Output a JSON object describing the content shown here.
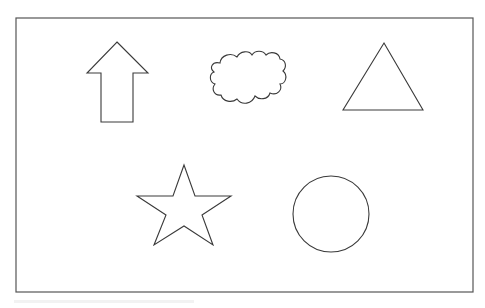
{
  "canvas": {
    "width": 485,
    "height": 308,
    "background": "#ffffff"
  },
  "frame": {
    "x": 16,
    "y": 18,
    "width": 457,
    "height": 274,
    "stroke": "#555555"
  },
  "shapes": [
    {
      "type": "arrow-up",
      "label": "Arrow",
      "points": "117,42 148,73 133,73 133,122 101,122 101,73 87,73",
      "stroke": "#3a3a3a"
    },
    {
      "type": "cloud",
      "label": "Cloud",
      "stroke": "#3a3a3a"
    },
    {
      "type": "triangle",
      "label": "Triangle",
      "points": "384,43 423,110 343,110",
      "stroke": "#3a3a3a"
    },
    {
      "type": "star",
      "label": "Star",
      "points": "184,165 195,196 231,196 202,215 213,245 184,226 154,245 166,215 137,196 173,196",
      "stroke": "#3a3a3a"
    },
    {
      "type": "circle",
      "label": "Circle",
      "cx": 331,
      "cy": 214,
      "r": 38,
      "stroke": "#3a3a3a"
    }
  ]
}
